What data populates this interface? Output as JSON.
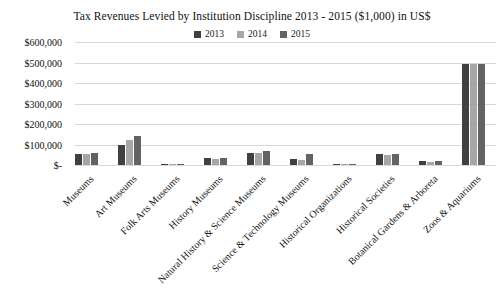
{
  "chart_data": {
    "type": "bar",
    "title": "Tax Revenues Levied by Institution Discipline 2013 - 2015 ($1,000) in US$",
    "xlabel": "",
    "ylabel": "",
    "grid": "horizontal",
    "legend_position": "top-center",
    "background_color": "#ffffff",
    "gridline_color": "#d9d9d9",
    "ylim": [
      0,
      600000
    ],
    "ytick_step": 100000,
    "ytick_labels": [
      "$-",
      "$100,000",
      "$200,000",
      "$300,000",
      "$400,000",
      "$500,000",
      "$600,000"
    ],
    "categories": [
      "Museums",
      "Art Museums",
      "Folk Arts Museums",
      "History Museums",
      "Natural History & Science Museums",
      "Science & Technology Museums",
      "Historical Organizations",
      "Historical Societies",
      "Botanical Gardens & Arboreta",
      "Zoos & Aquariums"
    ],
    "series": [
      {
        "name": "2013",
        "color": "#404040",
        "values": [
          55000,
          100000,
          7000,
          36000,
          60000,
          30000,
          5000,
          52000,
          18000,
          495000
        ]
      },
      {
        "name": "2014",
        "color": "#a6a6a6",
        "values": [
          54000,
          120000,
          5000,
          30000,
          60000,
          25000,
          4000,
          50000,
          15000,
          495000
        ]
      },
      {
        "name": "2015",
        "color": "#636363",
        "values": [
          57000,
          140000,
          7000,
          33000,
          66000,
          55000,
          5000,
          56000,
          18000,
          493000
        ]
      }
    ]
  }
}
